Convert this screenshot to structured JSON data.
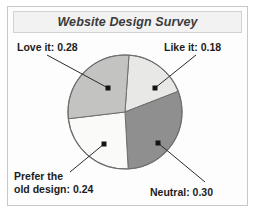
{
  "figure": {
    "title": "Website Design Survey",
    "frame_color": "#c8c8c8",
    "title_bg": "#f2f2f2"
  },
  "chart_data": {
    "type": "pie",
    "title": "Website Design Survey",
    "xlabel": "",
    "ylabel": "",
    "grid": false,
    "legend_position": "none",
    "labels_outside": true,
    "categories": [
      "Like it",
      "Neutral",
      "Prefer the old design",
      "Love it"
    ],
    "values": [
      0.18,
      0.3,
      0.24,
      0.28
    ],
    "slices": [
      {
        "name": "Like it",
        "value": 0.18,
        "label": "Like it: 0.18",
        "color": "#e8e8e6",
        "start_deg": 4,
        "end_deg": 68.8
      },
      {
        "name": "Neutral",
        "value": 0.3,
        "label": "Neutral: 0.30",
        "color": "#8f8f8f",
        "start_deg": 68.8,
        "end_deg": 176.8
      },
      {
        "name": "Prefer the old design",
        "value": 0.24,
        "label_line1": "Prefer the",
        "label_line2": "old design: 0.24",
        "color": "#fafaf8",
        "start_deg": 176.8,
        "end_deg": 263.2
      },
      {
        "name": "Love it",
        "value": 0.28,
        "label": "Love it: 0.28",
        "color": "#c3c3c1",
        "start_deg": 263.2,
        "end_deg": 364
      }
    ],
    "outline_color": "#6e6e6e",
    "leader_color": "#2b2b2b"
  }
}
